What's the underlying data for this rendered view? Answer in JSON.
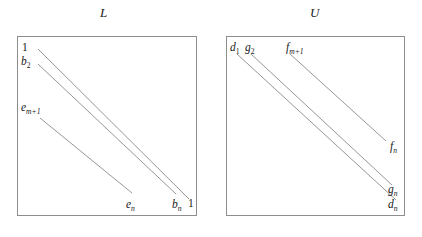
{
  "figure": {
    "type": "diagram"
  },
  "panels": [
    {
      "id": "L",
      "title": "L",
      "box": {
        "x": 17,
        "y": 36,
        "w": 180,
        "h": 180
      },
      "labels": [
        {
          "name": "label-L-one-top",
          "text": "1",
          "sub": "",
          "x": 22,
          "y": 41,
          "italic": false
        },
        {
          "name": "label-L-b2",
          "text": "b",
          "sub": "2",
          "x": 21,
          "y": 55,
          "italic": true,
          "sub_plain": true
        },
        {
          "name": "label-L-em1",
          "text": "e",
          "sub": "m+1",
          "x": 21,
          "y": 101,
          "italic": true,
          "sub_plain": false
        },
        {
          "name": "label-L-en",
          "text": "e",
          "sub": "n",
          "x": 126,
          "y": 198,
          "italic": true,
          "sub_plain": false
        },
        {
          "name": "label-L-bn",
          "text": "b",
          "sub": "n",
          "x": 172,
          "y": 198,
          "italic": true,
          "sub_plain": false
        },
        {
          "name": "label-L-one-bottom",
          "text": "1",
          "sub": "",
          "x": 188,
          "y": 197,
          "italic": false
        }
      ],
      "lines": [
        {
          "name": "band-line-L-1",
          "x1": 38,
          "y1": 49,
          "x2": 189,
          "y2": 199
        },
        {
          "name": "band-line-L-2",
          "x1": 38,
          "y1": 64,
          "x2": 176,
          "y2": 194
        },
        {
          "name": "band-line-L-3",
          "x1": 40,
          "y1": 118,
          "x2": 132,
          "y2": 193
        }
      ]
    },
    {
      "id": "U",
      "title": "U",
      "box": {
        "x": 226,
        "y": 36,
        "w": 179,
        "h": 180
      },
      "labels": [
        {
          "name": "label-U-d1",
          "text": "d",
          "sub": "1",
          "x": 230,
          "y": 41,
          "italic": true,
          "sub_plain": true
        },
        {
          "name": "label-U-g2",
          "text": "g",
          "sub": "2",
          "x": 245,
          "y": 41,
          "italic": true,
          "sub_plain": true
        },
        {
          "name": "label-U-fm1",
          "text": "f",
          "sub": "m+1",
          "x": 286,
          "y": 41,
          "italic": true,
          "sub_plain": false
        },
        {
          "name": "label-U-fn",
          "text": "f",
          "sub": "n",
          "x": 390,
          "y": 140,
          "italic": true,
          "sub_plain": false
        },
        {
          "name": "label-U-gn",
          "text": "g",
          "sub": "n",
          "x": 388,
          "y": 183,
          "italic": true,
          "sub_plain": false
        },
        {
          "name": "label-U-dn",
          "text": "d",
          "sub": "n",
          "x": 388,
          "y": 198,
          "italic": true,
          "sub_plain": false
        }
      ],
      "lines": [
        {
          "name": "band-line-U-1",
          "x1": 237,
          "y1": 54,
          "x2": 396,
          "y2": 200
        },
        {
          "name": "band-line-U-2",
          "x1": 251,
          "y1": 54,
          "x2": 392,
          "y2": 185
        },
        {
          "name": "band-line-U-3",
          "x1": 290,
          "y1": 54,
          "x2": 386,
          "y2": 141
        }
      ]
    }
  ],
  "titles": [
    {
      "name": "panel-title-L",
      "text": "L",
      "x": 100,
      "y": 5
    },
    {
      "name": "panel-title-U",
      "text": "U",
      "x": 310,
      "y": 5
    }
  ],
  "style": {
    "background": "#ffffff",
    "box_border": "#8d8d8d",
    "line_color": "#8a8a8a",
    "text_color": "#1a1a1a"
  }
}
